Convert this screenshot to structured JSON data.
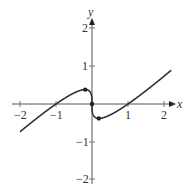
{
  "chart_data": {
    "type": "line",
    "title": "",
    "xlabel": "x",
    "ylabel": "y",
    "xlim": [
      -2.2,
      2.3
    ],
    "ylim": [
      -2.1,
      2.3
    ],
    "grid": false,
    "legend": null,
    "x_ticks": [
      "-2",
      "-1",
      "1",
      "2"
    ],
    "y_ticks": [
      "2",
      "1",
      "-1",
      "-2"
    ],
    "function": "y = x - x^(1/3)",
    "series": [
      {
        "name": "f(x)",
        "x": [
          -2,
          -1.5,
          -1,
          -0.5,
          -0.19,
          0,
          0.19,
          0.5,
          1,
          1.5,
          2,
          2.2
        ],
        "y": [
          -0.74,
          -0.36,
          0,
          0.29,
          0.385,
          0,
          -0.385,
          -0.29,
          0,
          0.36,
          0.74,
          0.9
        ]
      }
    ],
    "marked_points": [
      {
        "x": -0.19,
        "y": 0.385,
        "label": "local max"
      },
      {
        "x": 0,
        "y": 0,
        "label": "origin"
      },
      {
        "x": 0.19,
        "y": -0.385,
        "label": "local min"
      }
    ]
  },
  "labels": {
    "x_axis": "x",
    "y_axis": "y",
    "xt_m2": "−2",
    "xt_m1": "−1",
    "xt_1": "1",
    "xt_2": "2",
    "yt_2": "2",
    "yt_1": "1",
    "yt_m1": "−1",
    "yt_m2": "−2"
  }
}
